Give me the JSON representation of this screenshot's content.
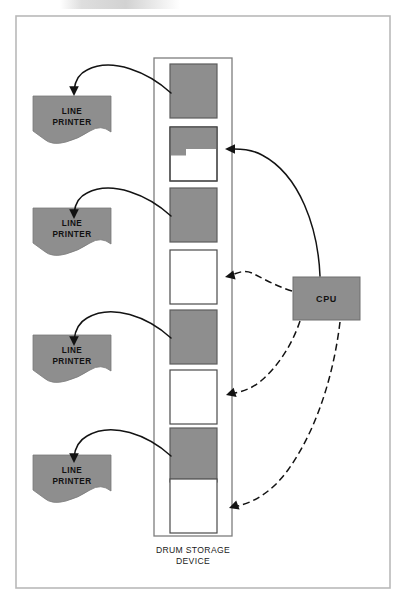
{
  "figure": {
    "caption": "DRUM STORAGE DEVICE",
    "caption_line1": "DRUM STORAGE",
    "caption_line2": "DEVICE",
    "colors": {
      "fill_gray": "#8e8e8e",
      "block_stroke": "#4a4a4a",
      "frame_stroke": "#b9b9b9",
      "line_black": "#131313",
      "page_background": "#ffffff"
    }
  },
  "cpu": {
    "label": "CPU",
    "x": 293,
    "y": 277,
    "width": 67,
    "height": 43
  },
  "printers": [
    {
      "label_line1": "LINE",
      "label_line2": "PRINTER",
      "name": "line-printer-1",
      "x": 33,
      "y": 96,
      "width": 78,
      "height": 44
    },
    {
      "label_line1": "LINE",
      "label_line2": "PRINTER",
      "name": "line-printer-2",
      "x": 33,
      "y": 208,
      "width": 78,
      "height": 44
    },
    {
      "label_line1": "LINE",
      "label_line2": "PRINTER",
      "name": "line-printer-3",
      "x": 33,
      "y": 335,
      "width": 78,
      "height": 44
    },
    {
      "label_line1": "LINE",
      "label_line2": "PRINTER",
      "name": "line-printer-4",
      "x": 33,
      "y": 455,
      "width": 78,
      "height": 44
    }
  ],
  "drum": {
    "container": {
      "x": 154,
      "y": 58,
      "width": 78,
      "height": 478
    },
    "blocks": [
      {
        "name": "drum-block-1",
        "state": "full",
        "x": 170,
        "y": 64,
        "width": 47,
        "height": 54
      },
      {
        "name": "drum-block-2",
        "state": "partial",
        "x": 170,
        "y": 127,
        "width": 47,
        "height": 54,
        "fill_fraction": 0.42
      },
      {
        "name": "drum-block-3",
        "state": "full",
        "x": 170,
        "y": 188,
        "width": 47,
        "height": 54
      },
      {
        "name": "drum-block-4",
        "state": "empty",
        "x": 170,
        "y": 250,
        "width": 47,
        "height": 54
      },
      {
        "name": "drum-block-5",
        "state": "full",
        "x": 170,
        "y": 310,
        "width": 47,
        "height": 54
      },
      {
        "name": "drum-block-6",
        "state": "empty",
        "x": 170,
        "y": 370,
        "width": 47,
        "height": 54
      },
      {
        "name": "drum-block-7",
        "state": "full",
        "x": 170,
        "y": 428,
        "width": 47,
        "height": 54
      },
      {
        "name": "drum-block-8",
        "state": "empty",
        "x": 170,
        "y": 479,
        "width": 47,
        "height": 54
      }
    ]
  },
  "arrows": {
    "drum_to_printer": [
      {
        "name": "arrow-block1-to-printer1",
        "style": "solid",
        "from_block": "drum-block-1",
        "to_printer": "line-printer-1"
      },
      {
        "name": "arrow-block3-to-printer2",
        "style": "solid",
        "from_block": "drum-block-3",
        "to_printer": "line-printer-2"
      },
      {
        "name": "arrow-block5-to-printer3",
        "style": "solid",
        "from_block": "drum-block-5",
        "to_printer": "line-printer-3"
      },
      {
        "name": "arrow-block7-to-printer4",
        "style": "solid",
        "from_block": "drum-block-7",
        "to_printer": "line-printer-4"
      }
    ],
    "cpu_to_drum": [
      {
        "name": "arrow-cpu-to-block2",
        "style": "solid",
        "from": "cpu",
        "to_block": "drum-block-2"
      },
      {
        "name": "arrow-cpu-to-block4",
        "style": "dashed",
        "from": "cpu",
        "to_block": "drum-block-4"
      },
      {
        "name": "arrow-cpu-to-block6",
        "style": "dashed",
        "from": "cpu",
        "to_block": "drum-block-6"
      },
      {
        "name": "arrow-cpu-to-block8",
        "style": "dashed",
        "from": "cpu",
        "to_block": "drum-block-8"
      }
    ]
  }
}
